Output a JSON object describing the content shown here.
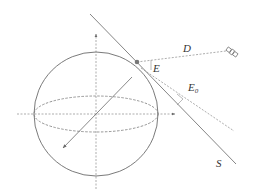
{
  "diagram": {
    "labels": {
      "D": "D",
      "E": "E",
      "E0": "E",
      "E0_sub": "0",
      "S": "S"
    },
    "colors": {
      "line": "#6b6b6b",
      "dashed": "#8a8a8a",
      "point": "#777777",
      "text": "#333333"
    }
  }
}
